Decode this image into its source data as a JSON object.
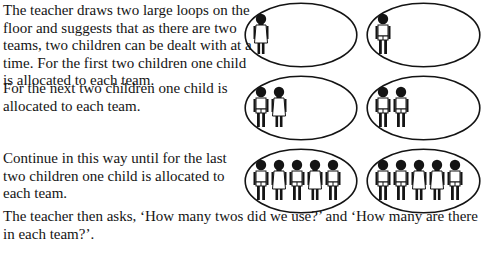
{
  "paragraphs": [
    "The teacher draws two large loops on the floor and suggests that as there are two teams, two children can be dealt with at a time. For the first two children one child is allocated to each team.",
    "For the next two children one child is allocated to each team.",
    "Continue in this way until for the last two children one child is allocated to each team.",
    "The teacher then asks, ‘How many twos did we use?’ and ‘How many are there in each team?’."
  ],
  "illustrations": [
    {
      "step": "first two children",
      "team_a": [
        "girl"
      ],
      "team_b": [
        "boy"
      ]
    },
    {
      "step": "next two children",
      "team_a": [
        "boy",
        "girl"
      ],
      "team_b": [
        "boy",
        "boy"
      ]
    },
    {
      "step": "last two children",
      "team_a": [
        "boy",
        "girl",
        "boy",
        "girl",
        "boy"
      ],
      "team_b": [
        "boy",
        "boy",
        "girl",
        "girl",
        "boy"
      ]
    }
  ],
  "colors": {
    "ink": "#141414",
    "background": "#ffffff"
  }
}
